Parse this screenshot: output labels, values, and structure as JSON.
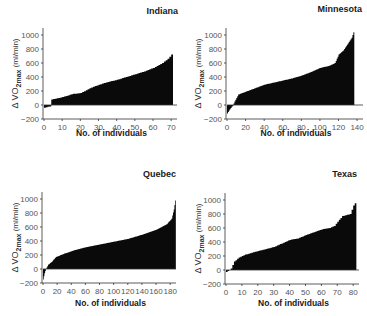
{
  "chart_data": [
    {
      "type": "bar",
      "title": "Indiana",
      "xlabel": "No. of individuals",
      "ylabel": "Δ VO2max (ml/min)",
      "xticks": [
        0,
        10,
        20,
        30,
        40,
        50,
        60,
        70
      ],
      "yticks": [
        -200,
        0,
        200,
        400,
        600,
        800,
        1000
      ],
      "xlim": [
        0,
        72
      ],
      "ylim": [
        -200,
        1100
      ],
      "n": 71,
      "sorted_ascending": true,
      "profile": [
        [
          0,
          -40
        ],
        [
          3,
          -20
        ],
        [
          4,
          80
        ],
        [
          8,
          100
        ],
        [
          12,
          130
        ],
        [
          16,
          160
        ],
        [
          20,
          170
        ],
        [
          25,
          240
        ],
        [
          30,
          290
        ],
        [
          35,
          330
        ],
        [
          40,
          360
        ],
        [
          45,
          400
        ],
        [
          50,
          440
        ],
        [
          55,
          480
        ],
        [
          60,
          530
        ],
        [
          65,
          600
        ],
        [
          68,
          660
        ],
        [
          71,
          750
        ]
      ]
    },
    {
      "type": "bar",
      "title": "Minnesota",
      "xlabel": "No. of individuals",
      "ylabel": "Δ VO2max (ml/min)",
      "xticks": [
        0,
        20,
        40,
        60,
        80,
        100,
        120,
        140
      ],
      "yticks": [
        -200,
        0,
        200,
        400,
        600,
        800,
        1000
      ],
      "xlim": [
        0,
        140
      ],
      "ylim": [
        -200,
        1100
      ],
      "n": 137,
      "sorted_ascending": true,
      "profile": [
        [
          0,
          -120
        ],
        [
          3,
          -60
        ],
        [
          6,
          -10
        ],
        [
          8,
          50
        ],
        [
          12,
          150
        ],
        [
          20,
          190
        ],
        [
          30,
          240
        ],
        [
          40,
          290
        ],
        [
          50,
          320
        ],
        [
          60,
          350
        ],
        [
          70,
          380
        ],
        [
          80,
          420
        ],
        [
          90,
          470
        ],
        [
          100,
          530
        ],
        [
          110,
          560
        ],
        [
          116,
          600
        ],
        [
          120,
          720
        ],
        [
          125,
          780
        ],
        [
          130,
          880
        ],
        [
          134,
          960
        ],
        [
          137,
          1080
        ]
      ]
    },
    {
      "type": "bar",
      "title": "Quebec",
      "xlabel": "No. of individuals",
      "ylabel": "Δ VO2max (ml/min)",
      "xticks": [
        0,
        20,
        40,
        60,
        80,
        100,
        120,
        140,
        160,
        180
      ],
      "yticks": [
        -200,
        0,
        200,
        400,
        600,
        800,
        1000
      ],
      "xlim": [
        0,
        190
      ],
      "ylim": [
        -200,
        1100
      ],
      "n": 188,
      "sorted_ascending": true,
      "profile": [
        [
          0,
          -150
        ],
        [
          2,
          -60
        ],
        [
          4,
          0
        ],
        [
          7,
          60
        ],
        [
          12,
          100
        ],
        [
          18,
          170
        ],
        [
          30,
          220
        ],
        [
          45,
          270
        ],
        [
          60,
          310
        ],
        [
          80,
          350
        ],
        [
          100,
          390
        ],
        [
          120,
          430
        ],
        [
          140,
          490
        ],
        [
          160,
          560
        ],
        [
          175,
          640
        ],
        [
          182,
          720
        ],
        [
          185,
          850
        ],
        [
          187,
          980
        ],
        [
          188,
          1100
        ]
      ]
    },
    {
      "type": "bar",
      "title": "Texas",
      "xlabel": "No. of individuals",
      "ylabel": "Δ VO2max (ml/min)",
      "xticks": [
        0,
        10,
        20,
        30,
        40,
        50,
        60,
        70,
        80
      ],
      "yticks": [
        -200,
        0,
        200,
        400,
        600,
        800,
        1000
      ],
      "xlim": [
        0,
        82
      ],
      "ylim": [
        -200,
        1100
      ],
      "n": 82,
      "sorted_ascending": true,
      "profile": [
        [
          0,
          -30
        ],
        [
          2,
          0
        ],
        [
          3,
          20
        ],
        [
          5,
          120
        ],
        [
          8,
          180
        ],
        [
          12,
          220
        ],
        [
          18,
          260
        ],
        [
          25,
          300
        ],
        [
          30,
          330
        ],
        [
          35,
          380
        ],
        [
          40,
          430
        ],
        [
          45,
          450
        ],
        [
          50,
          500
        ],
        [
          55,
          540
        ],
        [
          60,
          580
        ],
        [
          65,
          600
        ],
        [
          68,
          630
        ],
        [
          70,
          690
        ],
        [
          73,
          770
        ],
        [
          78,
          800
        ],
        [
          80,
          920
        ],
        [
          82,
          990
        ]
      ]
    }
  ],
  "figure": {
    "panels": [
      {
        "title": "Indiana",
        "xlabel": "No. of individuals",
        "ylabel_prefix": "Δ VO",
        "ylabel_sub": "2max",
        "ylabel_suffix": " (ml/min)"
      },
      {
        "title": "Minnesota",
        "xlabel": "No. of individuals",
        "ylabel_prefix": "Δ VO",
        "ylabel_sub": "2max",
        "ylabel_suffix": " (ml/min)"
      },
      {
        "title": "Quebec",
        "xlabel": "No. of individuals",
        "ylabel_prefix": "Δ VO",
        "ylabel_sub": "2max",
        "ylabel_suffix": " (ml/min)"
      },
      {
        "title": "Texas",
        "xlabel": "No. of individuals",
        "ylabel_prefix": "Δ VO",
        "ylabel_sub": "2max",
        "ylabel_suffix": " (ml/min)"
      }
    ]
  }
}
